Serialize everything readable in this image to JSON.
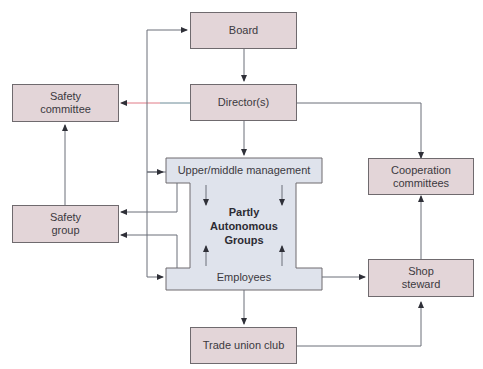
{
  "colors": {
    "node_fill": "#e3d5d8",
    "node_border": "#6f6a6e",
    "ishape_fill": "#dfe3ec",
    "line": "#6b6f78",
    "highlight_line": "#e07a86"
  },
  "nodes": {
    "board": "Board",
    "directors": "Director(s)",
    "safety_committee": "Safety\ncommittee",
    "cooperation_committees": "Cooperation\ncommittees",
    "safety_group": "Safety\ngroup",
    "shop_steward": "Shop\nsteward",
    "trade_union_club": "Trade union club"
  },
  "ishape": {
    "top_label": "Upper/middle management",
    "center_label": "Partly\nAutonomous\nGroups",
    "bottom_label": "Employees"
  },
  "edges": [
    {
      "from": "Board",
      "to": "Director(s)"
    },
    {
      "from": "Director(s)",
      "to": "Safety committee"
    },
    {
      "from": "Director(s)",
      "to": "Upper/middle management"
    },
    {
      "from": "Director(s)",
      "to": "Cooperation committees"
    },
    {
      "from": "Safety group",
      "to": "Safety committee"
    },
    {
      "from": "Upper/middle management",
      "to": "Safety group"
    },
    {
      "from": "Employees",
      "to": "Safety group"
    },
    {
      "from": "Employees",
      "to": "Shop steward"
    },
    {
      "from": "Employees",
      "to": "Trade union club"
    },
    {
      "from": "Trade union club",
      "to": "Shop steward"
    },
    {
      "from": "Shop steward",
      "to": "Cooperation committees"
    },
    {
      "from": "feedback loop",
      "to": "Board"
    },
    {
      "from": "feedback loop",
      "to": "Upper/middle management"
    },
    {
      "from": "feedback loop",
      "to": "Employees"
    },
    {
      "from": "Upper/middle management",
      "to": "Partly Autonomous Groups"
    },
    {
      "from": "Employees",
      "to": "Partly Autonomous Groups"
    }
  ]
}
